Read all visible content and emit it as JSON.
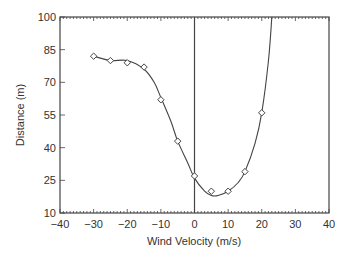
{
  "chart_data": {
    "type": "line",
    "title": "",
    "xlabel": "Wind Velocity (m/s)",
    "ylabel": "Distance (m)",
    "xlim": [
      -40,
      40
    ],
    "ylim": [
      10,
      100
    ],
    "xticks": [
      -40,
      -30,
      -20,
      -10,
      0,
      10,
      20,
      30,
      40
    ],
    "yticks": [
      10,
      25,
      40,
      55,
      70,
      85,
      100
    ],
    "grid": false,
    "legend": null,
    "vertical_reference_line_x": 0,
    "series": [
      {
        "name": "measured",
        "marker": "diamond",
        "x": [
          -30,
          -25,
          -20,
          -15,
          -10,
          -5,
          0,
          5,
          10,
          15,
          20
        ],
        "values": [
          82,
          80,
          79,
          77,
          62,
          43,
          27,
          20,
          20,
          29,
          56
        ]
      }
    ],
    "fit_curve": {
      "x": [
        -30,
        -25,
        -20,
        -15,
        -12,
        -10,
        -7,
        -5,
        -2,
        0,
        3,
        5,
        7,
        10,
        13,
        15,
        18,
        20,
        22,
        23
      ],
      "values": [
        82,
        80,
        80,
        76,
        70,
        63,
        52,
        43,
        33,
        26,
        20,
        18,
        18,
        20,
        24,
        29,
        42,
        56,
        80,
        100
      ]
    }
  }
}
